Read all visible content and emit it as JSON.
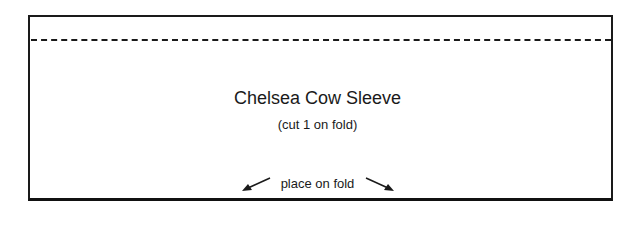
{
  "pattern": {
    "title": "Chelsea Cow Sleeve",
    "instruction": "(cut 1 on fold)",
    "fold_label": "place on fold",
    "line_color": "#1a1a1a"
  }
}
